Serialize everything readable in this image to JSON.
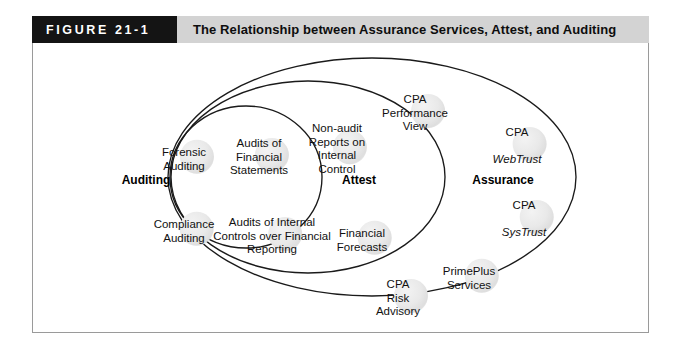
{
  "figure": {
    "tag": "FIGURE 21-1",
    "title": "The Relationship between Assurance Services, Attest, and Auditing"
  },
  "colors": {
    "tag_background": "#141414",
    "tag_text": "#ffffff",
    "title_background": "#d3d3d3",
    "title_text": "#0d0d0d",
    "frame_border": "#9a9a9a",
    "ellipse_stroke": "#1a1a1a",
    "blob_fill": "#e9e9e9",
    "page_background": "#ffffff"
  },
  "regions": [
    {
      "id": "auditing",
      "label": "Auditing"
    },
    {
      "id": "attest",
      "label": "Attest"
    },
    {
      "id": "assurance",
      "label": "Assurance"
    }
  ],
  "nodes": [
    {
      "id": "forensic-auditing",
      "region": "auditing",
      "text": "Forensic\nAuditing"
    },
    {
      "id": "audits-financial-stmts",
      "region": "auditing",
      "text": "Audits of\nFinancial\nStatements"
    },
    {
      "id": "compliance-auditing",
      "region": "auditing",
      "text": "Compliance\nAuditing"
    },
    {
      "id": "audits-internal-controls",
      "region": "auditing",
      "text": "Audits of Internal\nControls over Financial\nReporting"
    },
    {
      "id": "non-audit-reports",
      "region": "attest",
      "text": "Non-audit\nReports on\nInternal\nControl"
    },
    {
      "id": "financial-forecasts",
      "region": "attest",
      "text": "Financial\nForecasts"
    },
    {
      "id": "cpa-performance-view",
      "region": "assurance",
      "text": "CPA\nPerformance\nView"
    },
    {
      "id": "prime-plus-services",
      "region": "assurance",
      "text": "PrimePlus\nServices"
    },
    {
      "id": "cpa-risk-advisory",
      "region": "assurance",
      "text": "CPA\nRisk\nAdvisory"
    }
  ],
  "trademark_nodes": [
    {
      "id": "cpa-web-trust",
      "region": "assurance",
      "line1": "CPA",
      "line2": "WebTrust"
    },
    {
      "id": "cpa-sys-trust",
      "region": "assurance",
      "line1": "CPA",
      "line2": "SysTrust"
    }
  ]
}
